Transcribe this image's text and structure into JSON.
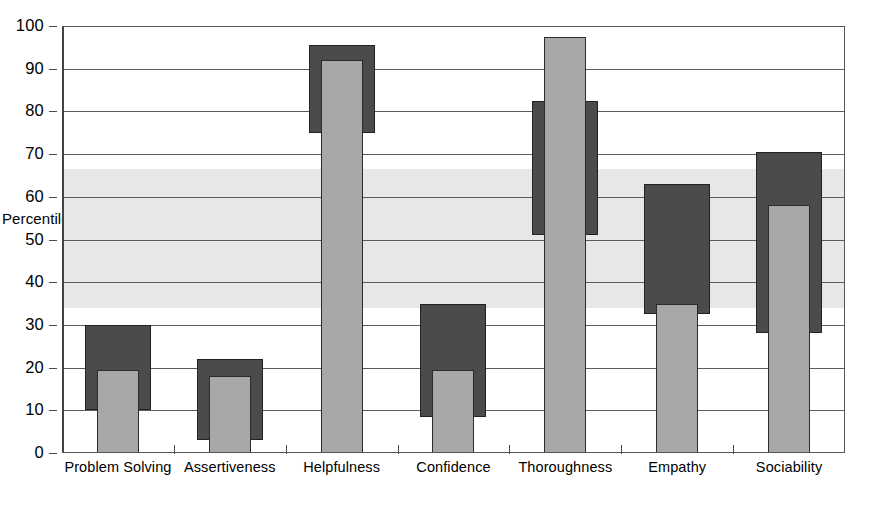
{
  "chart_data": {
    "type": "bar",
    "title": "",
    "subtitle": "",
    "xlabel": "",
    "ylabel": "Percentile",
    "ylim": [
      0,
      100
    ],
    "yticks": [
      0,
      10,
      20,
      30,
      40,
      50,
      60,
      70,
      80,
      90,
      100
    ],
    "grid": true,
    "legend": "none",
    "categories": [
      "Problem Solving",
      "Assertiveness",
      "Helpfulness",
      "Confidence",
      "Thoroughness",
      "Empathy",
      "Sociability"
    ],
    "series": [
      {
        "name": "Score",
        "type": "bar",
        "color": "#a8a8a8",
        "values": [
          19.5,
          18,
          92,
          19.5,
          97.5,
          35,
          58
        ]
      },
      {
        "name": "Range",
        "type": "range",
        "color": "#4b4b4b",
        "low": [
          10,
          3,
          75,
          8.5,
          51,
          32.5,
          28
        ],
        "high": [
          30,
          22,
          95.5,
          35,
          82.5,
          63,
          70.5
        ]
      }
    ],
    "shaded_band": {
      "label": "",
      "color": "#e7e7e7",
      "from": 34,
      "to": 66.5
    },
    "footnote": "",
    "colors": {
      "range_bar": "#4b4b4b",
      "value_bar": "#a8a8a8",
      "band": "#e7e7e7",
      "gridline": "#5b5b5b",
      "axis": "#444444",
      "text": "#000000"
    }
  }
}
